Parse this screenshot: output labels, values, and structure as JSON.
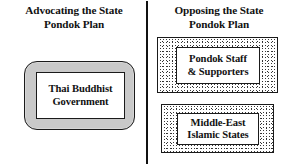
{
  "figure": {
    "type": "two-column-comparison-diagram",
    "background_color": "#ffffff",
    "divider_color": "#111111"
  },
  "columns": {
    "left": {
      "heading": {
        "line1": "Advocating the State",
        "line2": "Pondok Plan"
      },
      "nodes": [
        {
          "label_line1": "Thai Buddhist",
          "label_line2": "Government",
          "shape": "rounded-rectangle",
          "fill_color": "#c9c9c9",
          "inner_fill_color": "#ffffff",
          "border_color": "#1a1a1a"
        }
      ]
    },
    "right": {
      "heading": {
        "line1": "Opposing the State",
        "line2": "Pondok Plan"
      },
      "nodes": [
        {
          "label_line1": "Pondok Staff",
          "label_line2": "& Supporters",
          "shape": "rectangle",
          "fill_pattern": "stipple",
          "inner_fill_color": "#ffffff",
          "border_color": "#1a1a1a"
        },
        {
          "label_line1": "Middle-East",
          "label_line2": "Islamic States",
          "shape": "rectangle",
          "fill_pattern": "stipple",
          "inner_fill_color": "#ffffff",
          "border_color": "#1a1a1a"
        }
      ]
    }
  }
}
